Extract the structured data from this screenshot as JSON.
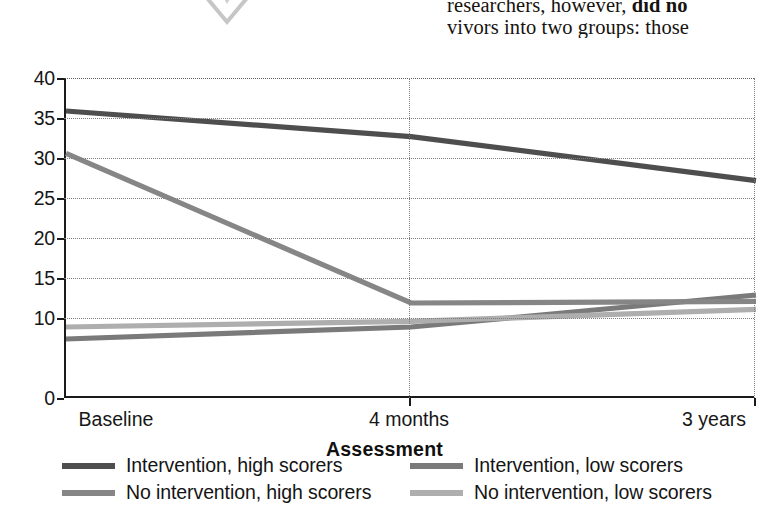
{
  "page_text": {
    "line1_prefix": "researchers, however, ",
    "line1_bold": "did no",
    "line2": "vivors into two groups: those"
  },
  "ornament": {
    "icon": "double-chevron-down-icon",
    "color": "#c9c9c9"
  },
  "chart_data": {
    "type": "line",
    "title": "",
    "xlabel": "Assessment",
    "ylabel": "",
    "categories": [
      "Baseline",
      "4 months",
      "3 years"
    ],
    "x": [
      0,
      1,
      2
    ],
    "ylim": [
      0,
      40
    ],
    "yticks": [
      0,
      10,
      15,
      20,
      25,
      30,
      35,
      40
    ],
    "ytick_labels": [
      "0",
      "10",
      "15",
      "20",
      "25",
      "30",
      "35",
      "40"
    ],
    "grid": true,
    "grid_style": "dotted",
    "legend_position": "bottom",
    "series": [
      {
        "name": "Intervention, high scorers",
        "values": [
          36.0,
          32.8,
          27.3
        ],
        "color": "#4e4e4e",
        "width": 5.2
      },
      {
        "name": "Intervention, low scorers",
        "values": [
          7.5,
          9.0,
          13.0
        ],
        "color": "#7a7a7a",
        "width": 5.2
      },
      {
        "name": "No intervention, high scorers",
        "values": [
          30.7,
          12.0,
          12.2
        ],
        "color": "#868686",
        "width": 5.2
      },
      {
        "name": "No intervention, low scorers",
        "values": [
          9.0,
          9.7,
          11.2
        ],
        "color": "#aeaeae",
        "width": 5.2
      }
    ]
  }
}
